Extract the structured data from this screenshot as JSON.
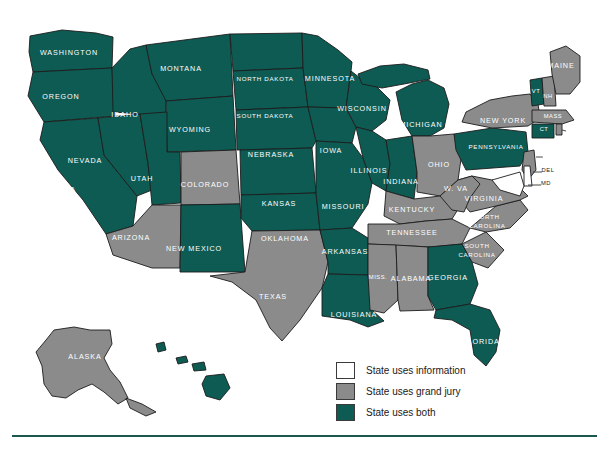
{
  "map": {
    "title": "United States grand jury / information map",
    "colors": {
      "both": "#0e5b53",
      "grand_jury": "#8b8b8b",
      "information": "#ffffff",
      "outline": "#1c1c1c",
      "rule": "#19574f",
      "background": "#ffffff"
    },
    "states": [
      {
        "code": "WA",
        "label": "WASHINGTON",
        "category": "both",
        "lx": 69,
        "ly": 55
      },
      {
        "code": "OR",
        "label": "OREGON",
        "category": "both",
        "lx": 61,
        "ly": 99
      },
      {
        "code": "ID",
        "label": "IDAHO",
        "category": "both",
        "lx": 125,
        "ly": 117
      },
      {
        "code": "MT",
        "label": "MONTANA",
        "category": "both",
        "lx": 181,
        "ly": 71
      },
      {
        "code": "WY",
        "label": "WYOMING",
        "category": "both",
        "lx": 190,
        "ly": 132
      },
      {
        "code": "NV",
        "label": "NEVADA",
        "category": "both",
        "lx": 85,
        "ly": 163
      },
      {
        "code": "UT",
        "label": "UTAH",
        "category": "both",
        "lx": 142,
        "ly": 181
      },
      {
        "code": "CA",
        "label": "CALIFORNIA",
        "category": "both",
        "lx": 50,
        "ly": 192
      },
      {
        "code": "AZ",
        "label": "ARIZONA",
        "category": "grand_jury",
        "lx": 131,
        "ly": 240
      },
      {
        "code": "CO",
        "label": "COLORADO",
        "category": "grand_jury",
        "lx": 205,
        "ly": 187
      },
      {
        "code": "NM",
        "label": "NEW MEXICO",
        "category": "both",
        "lx": 194,
        "ly": 251
      },
      {
        "code": "ND",
        "label": "NORTH DAKOTA",
        "category": "both",
        "lx": 265,
        "ly": 81
      },
      {
        "code": "SD",
        "label": "SOUTH DAKOTA",
        "category": "both",
        "lx": 265,
        "ly": 118
      },
      {
        "code": "NE",
        "label": "NEBRASKA",
        "category": "both",
        "lx": 271,
        "ly": 157
      },
      {
        "code": "KS",
        "label": "KANSAS",
        "category": "both",
        "lx": 279,
        "ly": 206
      },
      {
        "code": "OK",
        "label": "OKLAHOMA",
        "category": "both",
        "lx": 285,
        "ly": 241
      },
      {
        "code": "TX",
        "label": "TEXAS",
        "category": "grand_jury",
        "lx": 273,
        "ly": 299
      },
      {
        "code": "MN",
        "label": "MINNESOTA",
        "category": "both",
        "lx": 330,
        "ly": 81
      },
      {
        "code": "IA",
        "label": "IOWA",
        "category": "both",
        "lx": 331,
        "ly": 153
      },
      {
        "code": "MO",
        "label": "MISSOURI",
        "category": "both",
        "lx": 343,
        "ly": 209
      },
      {
        "code": "AR",
        "label": "ARKANSAS",
        "category": "both",
        "lx": 345,
        "ly": 254
      },
      {
        "code": "LA",
        "label": "LOUISIANA",
        "category": "both",
        "lx": 354,
        "ly": 317
      },
      {
        "code": "WI",
        "label": "WISCONSIN",
        "category": "both",
        "lx": 362,
        "ly": 111
      },
      {
        "code": "IL",
        "label": "ILLINOIS",
        "category": "both",
        "lx": 369,
        "ly": 173
      },
      {
        "code": "IN",
        "label": "INDIANA",
        "category": "both",
        "lx": 401,
        "ly": 184
      },
      {
        "code": "MI",
        "label": "MICHIGAN",
        "category": "both",
        "lx": 421,
        "ly": 127
      },
      {
        "code": "OH",
        "label": "OHIO",
        "category": "grand_jury",
        "lx": 439,
        "ly": 167
      },
      {
        "code": "KY",
        "label": "KENTUCKY",
        "category": "grand_jury",
        "lx": 412,
        "ly": 212
      },
      {
        "code": "TN",
        "label": "TENNESSEE",
        "category": "grand_jury",
        "lx": 412,
        "ly": 235
      },
      {
        "code": "MS",
        "label": "MISS.",
        "category": "grand_jury",
        "lx": 378,
        "ly": 279
      },
      {
        "code": "AL",
        "label": "ALABAMA",
        "category": "grand_jury",
        "lx": 411,
        "ly": 281
      },
      {
        "code": "GA",
        "label": "GEORGIA",
        "category": "both",
        "lx": 448,
        "ly": 280
      },
      {
        "code": "FL",
        "label": "FLORIDA",
        "category": "both",
        "lx": 481,
        "ly": 344
      },
      {
        "code": "SC",
        "label": "SOUTH\nCAROLINA",
        "category": "grand_jury",
        "lx": 477,
        "ly": 248
      },
      {
        "code": "NC",
        "label": "NORTH\nCAROLINA",
        "category": "grand_jury",
        "lx": 487,
        "ly": 219
      },
      {
        "code": "VA",
        "label": "VIRGINIA",
        "category": "grand_jury",
        "lx": 484,
        "ly": 201
      },
      {
        "code": "WV",
        "label": "W. VA",
        "category": "grand_jury",
        "lx": 456,
        "ly": 191
      },
      {
        "code": "PA",
        "label": "PENNSYLVANIA",
        "category": "both",
        "lx": 496,
        "ly": 149
      },
      {
        "code": "NY",
        "label": "NEW YORK",
        "category": "grand_jury",
        "lx": 503,
        "ly": 123
      },
      {
        "code": "VT",
        "label": "VT",
        "category": "both",
        "lx": 536,
        "ly": 93
      },
      {
        "code": "NH",
        "label": "NH",
        "category": "grand_jury",
        "lx": 548,
        "ly": 98
      },
      {
        "code": "ME",
        "label": "MAINE",
        "category": "grand_jury",
        "lx": 561,
        "ly": 68
      },
      {
        "code": "MA",
        "label": "MASS",
        "category": "grand_jury",
        "lx": 553,
        "ly": 118
      },
      {
        "code": "CT",
        "label": "CT",
        "category": "both",
        "lx": 544,
        "ly": 131
      },
      {
        "code": "RI",
        "label": "RI",
        "category": "grand_jury",
        "lx": 571,
        "ly": 131
      },
      {
        "code": "NJ",
        "label": "NJ",
        "category": "grand_jury",
        "lx": 546,
        "ly": 157
      },
      {
        "code": "DE",
        "label": "DEL",
        "category": "information",
        "lx": 548,
        "ly": 172
      },
      {
        "code": "MD",
        "label": "MD",
        "category": "information",
        "lx": 546,
        "ly": 185
      },
      {
        "code": "AK",
        "label": "ALASKA",
        "category": "grand_jury",
        "lx": 85,
        "ly": 359
      },
      {
        "code": "HI",
        "label": "HAWAII",
        "category": "both",
        "lx": 177,
        "ly": 375
      }
    ]
  },
  "legend": {
    "items": [
      {
        "key": "information",
        "label": "State uses information",
        "swatch": "info"
      },
      {
        "key": "grand_jury",
        "label": "State uses grand jury",
        "swatch": "grand"
      },
      {
        "key": "both",
        "label": "State uses both",
        "swatch": "both"
      }
    ]
  }
}
